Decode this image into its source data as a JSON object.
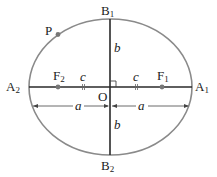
{
  "diagram": {
    "type": "ellipse-anatomy",
    "colors": {
      "ellipse": "#8a8a8a",
      "axis": "#2a2a2a",
      "point": "#777777",
      "text": "#222222"
    },
    "labels": {
      "B1": {
        "base": "B",
        "sub": "1"
      },
      "B2": {
        "base": "B",
        "sub": "2"
      },
      "A1": {
        "base": "A",
        "sub": "1"
      },
      "A2": {
        "base": "A",
        "sub": "2"
      },
      "F1": {
        "base": "F",
        "sub": "1"
      },
      "F2": {
        "base": "F",
        "sub": "2"
      },
      "O": "O",
      "P": "P",
      "b_top": "b",
      "b_bottom": "b",
      "c_left": "c",
      "c_right": "c",
      "a_left": "a",
      "a_right": "a"
    }
  }
}
